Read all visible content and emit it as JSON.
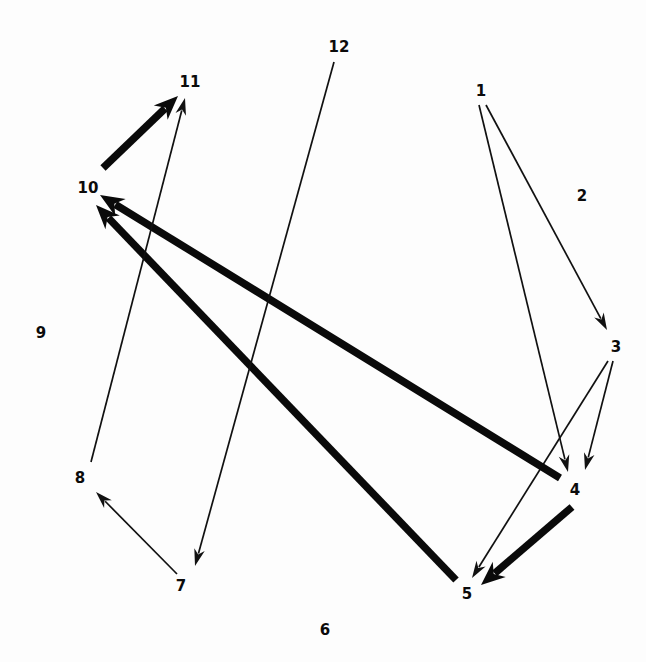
{
  "diagram": {
    "type": "directed-graph",
    "title": "",
    "width": 646,
    "height": 662,
    "background_color": "#fdfdfd",
    "node_color": "#0b0b0b",
    "edge_color": "#111111",
    "nodes": [
      {
        "id": "1",
        "label": "1",
        "x": 481,
        "y": 91,
        "isolated": false
      },
      {
        "id": "2",
        "label": "2",
        "x": 582,
        "y": 196,
        "isolated": true
      },
      {
        "id": "3",
        "label": "3",
        "x": 616,
        "y": 347,
        "isolated": false
      },
      {
        "id": "4",
        "label": "4",
        "x": 575,
        "y": 490,
        "isolated": false
      },
      {
        "id": "5",
        "label": "5",
        "x": 467,
        "y": 594,
        "isolated": false
      },
      {
        "id": "6",
        "label": "6",
        "x": 325,
        "y": 630,
        "isolated": true
      },
      {
        "id": "7",
        "label": "7",
        "x": 181,
        "y": 586,
        "isolated": false
      },
      {
        "id": "8",
        "label": "8",
        "x": 80,
        "y": 478,
        "isolated": false
      },
      {
        "id": "9",
        "label": "9",
        "x": 41,
        "y": 333,
        "isolated": true
      },
      {
        "id": "10",
        "label": "10",
        "x": 88,
        "y": 188,
        "isolated": false
      },
      {
        "id": "11",
        "label": "11",
        "x": 190,
        "y": 82,
        "isolated": false
      },
      {
        "id": "12",
        "label": "12",
        "x": 339,
        "y": 47,
        "isolated": false
      }
    ],
    "edges": [
      {
        "from": "1",
        "to": "3",
        "weight": "thin",
        "x1": 486,
        "y1": 105,
        "x2": 607,
        "y2": 330
      },
      {
        "from": "1",
        "to": "4",
        "weight": "thin",
        "x1": 479,
        "y1": 105,
        "x2": 568,
        "y2": 472
      },
      {
        "from": "3",
        "to": "4",
        "weight": "thin",
        "x1": 613,
        "y1": 361,
        "x2": 585,
        "y2": 470
      },
      {
        "from": "3",
        "to": "5",
        "weight": "thin",
        "x1": 608,
        "y1": 361,
        "x2": 472,
        "y2": 578
      },
      {
        "from": "4",
        "to": "5",
        "weight": "thick",
        "x1": 572,
        "y1": 507,
        "x2": 481,
        "y2": 585
      },
      {
        "from": "4",
        "to": "10",
        "weight": "thick",
        "x1": 560,
        "y1": 478,
        "x2": 100,
        "y2": 195
      },
      {
        "from": "5",
        "to": "10",
        "weight": "thick",
        "x1": 456,
        "y1": 580,
        "x2": 96,
        "y2": 205
      },
      {
        "from": "7",
        "to": "8",
        "weight": "thin",
        "x1": 177,
        "y1": 574,
        "x2": 96,
        "y2": 492
      },
      {
        "from": "8",
        "to": "11",
        "weight": "thin",
        "x1": 91,
        "y1": 462,
        "x2": 185,
        "y2": 98
      },
      {
        "from": "10",
        "to": "11",
        "weight": "thick",
        "x1": 103,
        "y1": 168,
        "x2": 178,
        "y2": 96
      },
      {
        "from": "12",
        "to": "7",
        "weight": "thin",
        "x1": 334,
        "y1": 62,
        "x2": 195,
        "y2": 566
      }
    ],
    "legend": {
      "thin_label": "thin edge",
      "thick_label": "thick edge"
    }
  }
}
